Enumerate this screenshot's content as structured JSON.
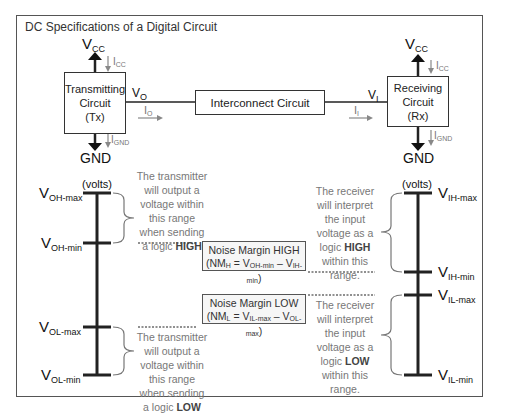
{
  "title": "DC Specifications of a Digital Circuit",
  "transmitter": {
    "line1": "Transmitting",
    "line2": "Circuit",
    "line3": "(Tx)",
    "vcc": "V",
    "vcc_sub": "CC",
    "icc": "I",
    "icc_sub": "CC",
    "ignd": "I",
    "ignd_sub": "GND",
    "gnd": "GND",
    "vo": "V",
    "vo_sub": "O",
    "io": "I",
    "io_sub": "O"
  },
  "interconnect": {
    "label": "Interconnect Circuit"
  },
  "receiver": {
    "line1": "Receiving",
    "line2": "Circuit",
    "line3": "(Rx)",
    "vcc": "V",
    "vcc_sub": "CC",
    "icc": "I",
    "icc_sub": "CC",
    "ignd": "I",
    "ignd_sub": "GND",
    "gnd": "GND",
    "vi": "V",
    "vi_sub": "I",
    "ii": "I",
    "ii_sub": "I"
  },
  "tx_scale": {
    "unit": "(volts)",
    "voh_max": "OH-max",
    "voh_min": "OH-min",
    "vol_max": "OL-max",
    "vol_min": "OL-min",
    "high_desc": [
      "The transmitter",
      "will output a",
      "voltage within",
      "this range",
      "when sending",
      "a logic "
    ],
    "high_bold": "HIGH",
    "low_desc": [
      "The transmitter",
      "will output a",
      "voltage within",
      "this range",
      "when sending",
      "a logic "
    ],
    "low_bold": "LOW"
  },
  "rx_scale": {
    "unit": "(volts)",
    "vih_max": "IH-max",
    "vih_min": "IH-min",
    "vil_max": "IL-max",
    "vil_min": "IL-min",
    "high_desc": [
      "The receiver",
      "will interpret",
      "the input",
      "voltage as a",
      "logic ",
      "within this",
      "range."
    ],
    "high_bold": "HIGH",
    "low_desc": [
      "The receiver",
      "will interpret",
      "the input",
      "voltage as a",
      "logic ",
      "within this",
      "range."
    ],
    "low_bold": "LOW"
  },
  "noise_margin_high": {
    "title": "Noise Margin HIGH",
    "nm": "NM",
    "nm_sub": "H",
    "eq": " = V",
    "a_sub": "OH-min",
    "minus": " – V",
    "b_sub": "IH-min"
  },
  "noise_margin_low": {
    "title": "Noise Margin LOW",
    "nm": "NM",
    "nm_sub": "L",
    "eq": " = V",
    "a_sub": "IL-max",
    "minus": " – V",
    "b_sub": "OL-max"
  }
}
